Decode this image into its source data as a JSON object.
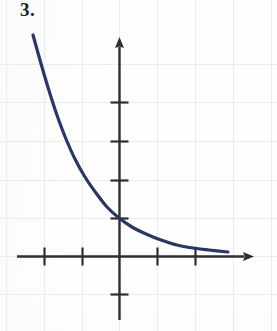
{
  "worksheet": {
    "problem_label": "3.",
    "label_color": "#1c2236"
  },
  "figure": {
    "name": "exponential-decay-graph",
    "background_color": "#fdfdfd",
    "grid_color": "#e9e9ee",
    "axis_color": "#303030",
    "tick_color": "#303030",
    "curve_color": "#2a3766",
    "curve_width": 3.2
  },
  "chart_data": {
    "type": "line",
    "title": "",
    "subtitle": "",
    "xlabel": "",
    "ylabel": "",
    "grid": true,
    "grid_spacing_units": 1,
    "legend": "none",
    "annotations": [
      "3."
    ],
    "function": "y = a*b^x, 0 < b < 1",
    "origin_px": {
      "x": 119,
      "y": 256
    },
    "unit_px": 38,
    "xlim": [
      -2.7,
      3.6
    ],
    "ylim": [
      -1.8,
      5.8
    ],
    "x_axis": {
      "start_px": 17,
      "end_px": 253,
      "arrow": "right",
      "tick_positions_px": [
        44,
        82,
        157,
        195
      ],
      "tick_values": [
        -2,
        -1,
        1,
        2
      ],
      "tick_labels": [
        "",
        "",
        "",
        ""
      ],
      "tick_half_length_px": 9
    },
    "y_axis": {
      "start_px": 320,
      "end_px": 38,
      "arrow": "up",
      "tick_positions_px": [
        102,
        141,
        180,
        218,
        294
      ],
      "tick_values": [
        4,
        3,
        2,
        1,
        -1
      ],
      "tick_labels": [
        "",
        "",
        "",
        "",
        ""
      ],
      "tick_half_length_px": 9
    },
    "gridlines": {
      "vertical_px": [
        6,
        44,
        82,
        119,
        157,
        195,
        233,
        271
      ],
      "horizontal_px": [
        64,
        102,
        141,
        180,
        218,
        256,
        294
      ]
    },
    "series": [
      {
        "name": "exponential-decay",
        "color": "#2a3766",
        "points_px": [
          [
            33,
            35
          ],
          [
            38,
            53
          ],
          [
            44,
            74
          ],
          [
            51,
            97
          ],
          [
            58,
            118
          ],
          [
            66,
            139
          ],
          [
            75,
            159
          ],
          [
            85,
            177
          ],
          [
            96,
            193
          ],
          [
            107,
            207
          ],
          [
            119,
            218
          ],
          [
            132,
            227
          ],
          [
            146,
            234
          ],
          [
            161,
            240
          ],
          [
            177,
            245
          ],
          [
            193,
            248
          ],
          [
            209,
            250
          ],
          [
            228,
            252
          ]
        ],
        "points_data": [
          [
            -2.26,
            5.82
          ],
          [
            -2.13,
            5.34
          ],
          [
            -1.97,
            4.79
          ],
          [
            -1.79,
            4.18
          ],
          [
            -1.61,
            3.63
          ],
          [
            -1.39,
            3.08
          ],
          [
            -1.16,
            2.55
          ],
          [
            -0.89,
            2.08
          ],
          [
            -0.61,
            1.66
          ],
          [
            -0.32,
            1.29
          ],
          [
            0.0,
            1.0
          ],
          [
            0.34,
            0.76
          ],
          [
            0.71,
            0.58
          ],
          [
            1.11,
            0.42
          ],
          [
            1.53,
            0.29
          ],
          [
            1.95,
            0.21
          ],
          [
            2.37,
            0.16
          ],
          [
            2.87,
            0.11
          ]
        ]
      }
    ]
  }
}
